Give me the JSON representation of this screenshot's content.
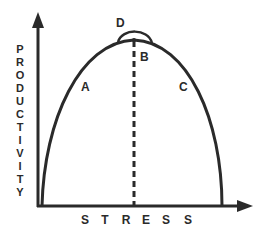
{
  "diagram": {
    "x_axis_label": "STRESS",
    "y_axis_label": "PRODUCTIVITY",
    "y_axis_letters": [
      "P",
      "R",
      "O",
      "D",
      "U",
      "C",
      "T",
      "I",
      "V",
      "I",
      "T",
      "Y"
    ],
    "x_axis_letters": [
      "S",
      "T",
      "R",
      "E",
      "S",
      "S"
    ],
    "points": {
      "A": "A",
      "B": "B",
      "C": "C",
      "D": "D"
    },
    "curve": "inverted-U productivity vs stress",
    "colors": {
      "line": "#2a2a2a",
      "background": "#ffffff"
    }
  }
}
